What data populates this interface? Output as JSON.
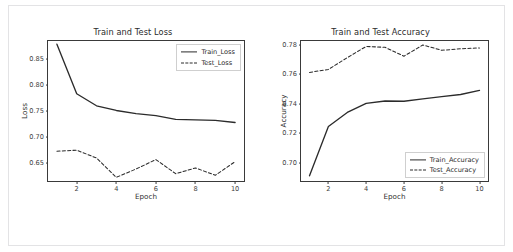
{
  "figure": {
    "background_color": "#ffffff",
    "border_color": "#e3e3e5",
    "line_color": "#2b2b2b"
  },
  "chart_data": [
    {
      "type": "line",
      "title": "Train and Test Loss",
      "xlabel": "Epoch",
      "ylabel": "Loss",
      "x": [
        1,
        2,
        3,
        4,
        5,
        6,
        7,
        8,
        9,
        10
      ],
      "xticks": [
        2,
        4,
        6,
        8,
        10
      ],
      "yticks": [
        0.65,
        0.7,
        0.75,
        0.8,
        0.85
      ],
      "xlim": [
        0.55,
        10.45
      ],
      "ylim": [
        0.616,
        0.884
      ],
      "grid": false,
      "legend_position": "upper right",
      "series": [
        {
          "name": "Train_Loss",
          "style": "solid",
          "values": [
            0.878,
            0.783,
            0.76,
            0.751,
            0.745,
            0.741,
            0.734,
            0.733,
            0.732,
            0.728
          ]
        },
        {
          "name": "Test_Loss",
          "style": "dashed",
          "values": [
            0.673,
            0.675,
            0.66,
            0.623,
            0.639,
            0.657,
            0.63,
            0.641,
            0.627,
            0.653
          ]
        }
      ]
    },
    {
      "type": "line",
      "title": "Train and Test Accuracy",
      "xlabel": "Epoch",
      "ylabel": "Accuracy",
      "x": [
        1,
        2,
        3,
        4,
        5,
        6,
        7,
        8,
        9,
        10
      ],
      "xticks": [
        2,
        4,
        6,
        8,
        10
      ],
      "yticks": [
        0.7,
        0.72,
        0.74,
        0.76,
        0.78
      ],
      "xlim": [
        0.55,
        10.45
      ],
      "ylim": [
        0.6875,
        0.7825
      ],
      "grid": false,
      "legend_position": "lower right",
      "series": [
        {
          "name": "Train_Accuracy",
          "style": "solid",
          "values": [
            0.691,
            0.7245,
            0.734,
            0.7402,
            0.7418,
            0.7416,
            0.7432,
            0.7447,
            0.7462,
            0.749
          ]
        },
        {
          "name": "Test_Accuracy",
          "style": "dashed",
          "values": [
            0.7612,
            0.7632,
            0.7712,
            0.7788,
            0.7782,
            0.7722,
            0.7798,
            0.7762,
            0.7772,
            0.7778
          ]
        }
      ]
    }
  ]
}
